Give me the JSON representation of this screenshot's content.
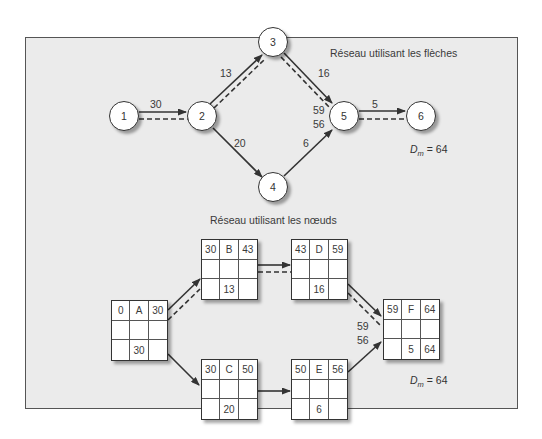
{
  "arrow_network": {
    "title": "Réseau utilisant les flèches",
    "nodes": [
      {
        "id": "1",
        "label": "1"
      },
      {
        "id": "2",
        "label": "2"
      },
      {
        "id": "3",
        "label": "3"
      },
      {
        "id": "4",
        "label": "4"
      },
      {
        "id": "5",
        "label": "5"
      },
      {
        "id": "6",
        "label": "6"
      }
    ],
    "arcs": [
      {
        "from": "1",
        "to": "2",
        "duration": "30",
        "critical": true
      },
      {
        "from": "2",
        "to": "3",
        "duration": "13",
        "critical": true
      },
      {
        "from": "2",
        "to": "4",
        "duration": "20",
        "critical": false
      },
      {
        "from": "3",
        "to": "5",
        "duration": "16",
        "critical": true
      },
      {
        "from": "4",
        "to": "5",
        "duration": "6",
        "critical": false
      },
      {
        "from": "5",
        "to": "6",
        "duration": "5",
        "critical": true
      }
    ],
    "merge_labels": {
      "upper": "59",
      "lower": "56"
    },
    "duration_label": {
      "symbol": "D",
      "subscript": "m",
      "value": "= 64"
    }
  },
  "node_network": {
    "title": "Réseau utilisant les nœuds",
    "activities": [
      {
        "name": "A",
        "es": "0",
        "ef": "30",
        "dur": "30",
        "ls": "",
        "lf": ""
      },
      {
        "name": "B",
        "es": "30",
        "ef": "43",
        "dur": "13",
        "ls": "",
        "lf": ""
      },
      {
        "name": "C",
        "es": "30",
        "ef": "50",
        "dur": "20",
        "ls": "",
        "lf": ""
      },
      {
        "name": "D",
        "es": "43",
        "ef": "59",
        "dur": "16",
        "ls": "",
        "lf": ""
      },
      {
        "name": "E",
        "es": "50",
        "ef": "56",
        "dur": "6",
        "ls": "",
        "lf": ""
      },
      {
        "name": "F",
        "es": "59",
        "ef": "64",
        "dur": "5",
        "ls": "",
        "lf": "64"
      }
    ],
    "links": [
      {
        "from": "A",
        "to": "B",
        "critical": true
      },
      {
        "from": "A",
        "to": "C",
        "critical": false
      },
      {
        "from": "B",
        "to": "D",
        "critical": true
      },
      {
        "from": "C",
        "to": "E",
        "critical": false
      },
      {
        "from": "D",
        "to": "F",
        "critical": true
      },
      {
        "from": "E",
        "to": "F",
        "critical": false
      }
    ],
    "merge_labels": {
      "upper": "59",
      "lower": "56"
    },
    "duration_label": {
      "symbol": "D",
      "subscript": "m",
      "value": "= 64"
    }
  },
  "colors": {
    "panel_bg": "#ebebeb",
    "line": "#333333",
    "node_fill": "#ffffff"
  }
}
